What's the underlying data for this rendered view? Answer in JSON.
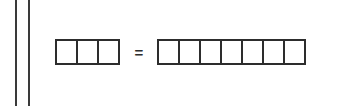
{
  "canvas": {
    "width": 340,
    "height": 106,
    "background_color": "#ffffff",
    "stroke_color": "#2d2d2d",
    "rule_color": "#3a3a3a"
  },
  "margin_rules": {
    "name": "double-margin-rule",
    "count": 2,
    "orientation": "vertical",
    "positions_px": [
      15,
      28
    ]
  },
  "diagram": {
    "type": "bar-model-equivalence",
    "left_group": {
      "label": "left-unit-row",
      "unit_count": 3,
      "unit_labels": [
        "",
        "",
        ""
      ],
      "fill": "#ffffff"
    },
    "operator": {
      "symbol": "=",
      "name": "equals"
    },
    "right_group": {
      "label": "right-unit-row",
      "unit_count": 7,
      "unit_labels": [
        "",
        "",
        "",
        "",
        "",
        "",
        ""
      ],
      "fill": "#ffffff"
    }
  },
  "chart_data": {
    "type": "bar",
    "title": "",
    "xlabel": "",
    "ylabel": "",
    "categories": [
      "left group",
      "right group"
    ],
    "values": [
      3,
      7
    ],
    "annotations": [
      "="
    ],
    "grid": false,
    "legend": "none"
  }
}
